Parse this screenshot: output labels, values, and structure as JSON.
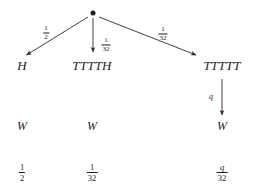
{
  "figure": {
    "type": "probability-tree-diagram",
    "background_color": "#ffffff",
    "ink_color": "#1d1d1d",
    "root": {
      "name": "root-node",
      "glyph": "dot"
    },
    "branches": [
      {
        "id": "left",
        "weight_numerator": "1",
        "weight_denominator": "2",
        "outcome": "H",
        "payoff": "W",
        "result_numerator": "1",
        "result_denominator": "2"
      },
      {
        "id": "middle",
        "weight_numerator": "1",
        "weight_denominator": "32",
        "outcome": "TTTTH",
        "payoff": "W",
        "result_numerator": "1",
        "result_denominator": "32"
      },
      {
        "id": "right",
        "weight_numerator": "1",
        "weight_denominator": "32",
        "outcome": "TTTTT",
        "payoff": "W",
        "sub_weight": "q",
        "result_numerator": "q",
        "result_denominator": "32"
      }
    ]
  }
}
